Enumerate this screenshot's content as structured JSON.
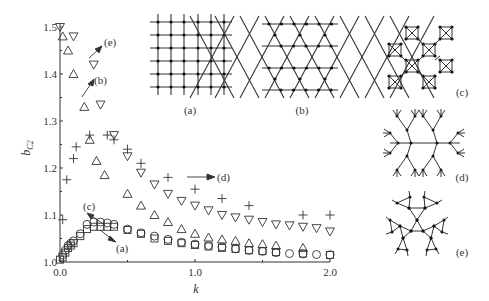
{
  "chart_data": {
    "type": "scatter",
    "title": "",
    "xlabel": "k",
    "ylabel": "b_C2",
    "ylabel_main": "b",
    "ylabel_sub": "C2",
    "xlim": [
      0.0,
      2.0
    ],
    "ylim": [
      1.0,
      1.5
    ],
    "xticks": [
      "0.0",
      "1.0",
      "2.0"
    ],
    "yticks": [
      "1.0",
      "1.1",
      "1.2",
      "1.3",
      "1.4",
      "1.5"
    ],
    "grid": false,
    "legend_position": "none (inline arrow annotations)",
    "series": [
      {
        "name": "(a) square lattice",
        "marker": "square",
        "x": [
          0.0,
          0.02,
          0.04,
          0.06,
          0.08,
          0.1,
          0.15,
          0.2,
          0.25,
          0.3,
          0.35,
          0.4,
          0.5,
          0.6,
          0.7,
          0.8,
          0.9,
          1.0,
          1.1,
          1.2,
          1.3,
          1.4,
          1.5,
          1.6,
          1.8,
          2.0
        ],
        "y": [
          1.005,
          1.01,
          1.02,
          1.03,
          1.035,
          1.04,
          1.055,
          1.07,
          1.075,
          1.075,
          1.075,
          1.075,
          1.068,
          1.06,
          1.05,
          1.045,
          1.04,
          1.036,
          1.033,
          1.03,
          1.028,
          1.025,
          1.023,
          1.021,
          1.018,
          1.015
        ]
      },
      {
        "name": "(b) kagome lattice",
        "marker": "triangle-up",
        "x": [
          0.02,
          0.06,
          0.1,
          0.18,
          0.22,
          0.27,
          0.33,
          0.5,
          0.6,
          0.7,
          0.8,
          0.9,
          1.0,
          1.1,
          1.2,
          1.3,
          1.4,
          1.5,
          1.6,
          1.8
        ],
        "y": [
          1.48,
          1.45,
          1.4,
          1.33,
          1.26,
          1.215,
          1.185,
          1.145,
          1.12,
          1.1,
          1.085,
          1.07,
          1.06,
          1.052,
          1.048,
          1.045,
          1.04,
          1.038,
          1.035,
          1.03
        ]
      },
      {
        "name": "(c) square-of-squares lattice",
        "marker": "circle",
        "x": [
          0.02,
          0.04,
          0.06,
          0.08,
          0.1,
          0.15,
          0.2,
          0.25,
          0.3,
          0.35,
          0.4,
          0.5,
          0.6,
          0.7,
          0.8,
          0.9,
          1.0,
          1.1,
          1.2,
          1.3,
          1.4,
          1.5,
          1.6,
          1.7,
          1.8,
          1.9,
          2.0
        ],
        "y": [
          1.015,
          1.025,
          1.035,
          1.04,
          1.045,
          1.06,
          1.08,
          1.085,
          1.085,
          1.083,
          1.08,
          1.07,
          1.062,
          1.055,
          1.048,
          1.042,
          1.038,
          1.035,
          1.032,
          1.028,
          1.025,
          1.023,
          1.02,
          1.018,
          1.017,
          1.016,
          1.015
        ]
      },
      {
        "name": "(d) Cayley tree",
        "marker": "plus",
        "x": [
          0.02,
          0.05,
          0.1,
          0.12,
          0.22,
          0.35,
          0.4,
          0.5,
          0.6,
          0.8,
          1.0,
          1.2,
          1.4,
          1.8,
          2.0
        ],
        "y": [
          1.09,
          1.175,
          1.22,
          1.245,
          1.27,
          1.27,
          1.26,
          1.24,
          1.21,
          1.18,
          1.155,
          1.135,
          1.12,
          1.1,
          1.1
        ]
      },
      {
        "name": "(e) Husimi cactus",
        "marker": "triangle-down",
        "x": [
          0.0,
          0.1,
          0.25,
          0.3,
          0.4,
          0.5,
          0.6,
          0.7,
          0.8,
          0.9,
          1.0,
          1.1,
          1.2,
          1.3,
          1.4,
          1.5,
          1.6,
          1.7,
          1.8,
          1.9,
          2.0
        ],
        "y": [
          1.5,
          1.48,
          1.42,
          1.335,
          1.27,
          1.225,
          1.19,
          1.165,
          1.145,
          1.13,
          1.12,
          1.11,
          1.1,
          1.095,
          1.09,
          1.085,
          1.08,
          1.078,
          1.075,
          1.072,
          1.065
        ]
      }
    ],
    "annotations": [
      {
        "text": "(e)",
        "target_series": "triangle-down"
      },
      {
        "text": "(b)",
        "target_series": "triangle-up"
      },
      {
        "text": "(d)",
        "target_series": "plus"
      },
      {
        "text": "(c)",
        "target_series": "circle"
      },
      {
        "text": "(a)",
        "target_series": "square"
      }
    ]
  },
  "insets": {
    "a": {
      "label": "(a)",
      "description": "square lattice"
    },
    "b": {
      "label": "(b)",
      "description": "kagome lattice"
    },
    "c": {
      "label": "(c)",
      "description": "lattice of squares with crossed diagonals"
    },
    "d": {
      "label": "(d)",
      "description": "Cayley tree"
    },
    "e": {
      "label": "(e)",
      "description": "Husimi cactus of triangles"
    }
  },
  "colors": {
    "ink": "#333333",
    "background": "#ffffff"
  }
}
